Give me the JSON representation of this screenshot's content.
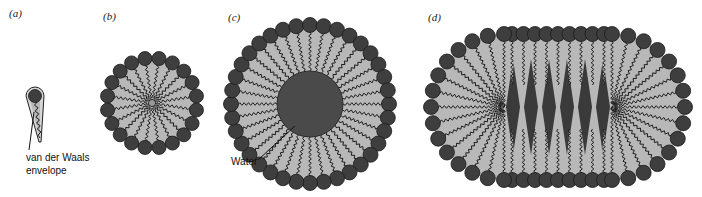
{
  "figure": {
    "panels": [
      {
        "id": "a",
        "label": "(a)",
        "description": "single amphiphile molecule"
      },
      {
        "id": "b",
        "label": "(b)",
        "description": "spherical micelle"
      },
      {
        "id": "c",
        "label": "(c)",
        "description": "aggregate with water core"
      },
      {
        "id": "d",
        "label": "(d)",
        "description": "elongated micelle"
      }
    ],
    "annotations": {
      "vdw_line1": "van der Waals",
      "vdw_line2": "envelope",
      "water": "Water"
    },
    "colors": {
      "head": "#3e3e3e",
      "head_edge": "#1a1a1a",
      "tail_fill": "#b8b8b8",
      "tail_line": "#1e1e1e",
      "core": "#4a4a4a",
      "wedge_dark": "#3a3a3a",
      "background": "#ffffff"
    },
    "geometry": {
      "b": {
        "cx": 152,
        "cy": 103,
        "ring_r": 45,
        "head_r": 7,
        "count": 20
      },
      "c": {
        "cx": 310,
        "cy": 104,
        "ring_r": 79,
        "head_r": 7.5,
        "count": 36,
        "core_r": 33
      },
      "d": {
        "cx": 558,
        "cy": 107,
        "half_straight": 54,
        "ring_r": 73,
        "head_r": 7.5
      }
    }
  }
}
